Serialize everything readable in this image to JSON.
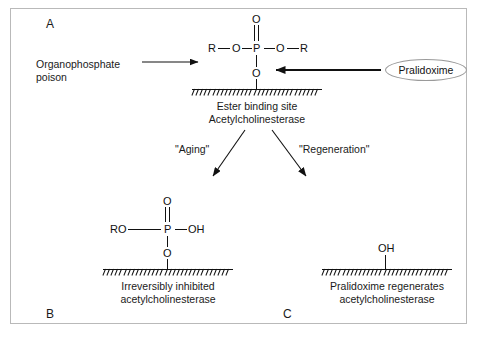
{
  "figure": {
    "panels": {
      "a": "A",
      "b": "B",
      "c": "C"
    },
    "panel_a": {
      "input_label": {
        "line1": "Organophosphate",
        "line2": "poison"
      },
      "structure": {
        "top_oxygen": "O",
        "left_r": "R",
        "left_o": "O",
        "phosphorus": "P",
        "right_o": "O",
        "right_r": "R",
        "bottom_o": "O"
      },
      "surface_caption": {
        "line1": "Ester binding site",
        "line2": "Acetylcholinesterase"
      },
      "reagent": "Pralidoxime"
    },
    "branches": {
      "left": "\"Aging\"",
      "right": "\"Regeneration\""
    },
    "panel_b": {
      "structure": {
        "top_oxygen": "O",
        "left_group": "RO",
        "phosphorus": "P",
        "right_group": "OH",
        "bottom_o": "O"
      },
      "caption": {
        "line1": "Irreversibly inhibited",
        "line2": "acetylcholinesterase"
      }
    },
    "panel_c": {
      "structure": {
        "hydroxyl": "OH"
      },
      "caption": {
        "line1": "Pralidoxime regenerates",
        "line2": "acetylcholinesterase"
      }
    },
    "colors": {
      "ink": "#111111",
      "border": "#b9b9b9",
      "pill_stroke": "#9a9a9a",
      "background": "#ffffff"
    }
  }
}
